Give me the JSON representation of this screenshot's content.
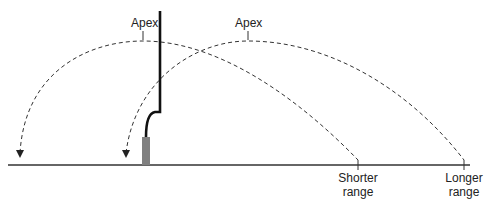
{
  "diagram": {
    "type": "trajectory-comparison",
    "colors": {
      "line": "#1a1a1a",
      "dashed": "#333333",
      "base": "#808080",
      "background": "#ffffff"
    },
    "trajectories": [
      {
        "name": "shorter",
        "apex_label": "Apex",
        "range_label_line1": "Shorter",
        "range_label_line2": "range"
      },
      {
        "name": "longer",
        "apex_label": "Apex",
        "range_label_line1": "Longer",
        "range_label_line2": "range"
      }
    ]
  }
}
